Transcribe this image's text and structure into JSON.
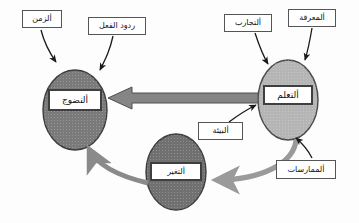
{
  "diagram": {
    "language": "ar",
    "background_color": "#fdfdfd",
    "nodes": [
      {
        "id": "maturity",
        "label": "ألنضوج",
        "shape": "ellipse",
        "fill": "#7a7a7a",
        "stroke": "#3d3d3d",
        "cx": 75,
        "cy": 110,
        "rx": 32,
        "ry": 40
      },
      {
        "id": "learning",
        "label": "ألتعلم",
        "shape": "ellipse",
        "fill": "#b5b5b5",
        "stroke": "#4a4a4a",
        "cx": 288,
        "cy": 100,
        "rx": 30,
        "ry": 40
      },
      {
        "id": "change",
        "label": "ألتغير",
        "shape": "ellipse",
        "fill": "#707070",
        "stroke": "#3d3d3d",
        "cx": 176,
        "cy": 172,
        "rx": 30,
        "ry": 38
      }
    ],
    "callouts": [
      {
        "id": "time",
        "label": "ألزمن",
        "target": "maturity",
        "x": 22,
        "y": 10,
        "w": 40,
        "h": 18
      },
      {
        "id": "reactions",
        "label": "ردود الفعل",
        "target": "maturity",
        "x": 88,
        "y": 17,
        "w": 58,
        "h": 18
      },
      {
        "id": "experiences",
        "label": "ألتجارب",
        "target": "learning",
        "x": 224,
        "y": 14,
        "w": 48,
        "h": 18
      },
      {
        "id": "knowledge",
        "label": "ألمعرفة",
        "target": "learning",
        "x": 288,
        "y": 9,
        "w": 48,
        "h": 18
      },
      {
        "id": "environment",
        "label": "ألبيئة",
        "target": "learning",
        "x": 198,
        "y": 122,
        "w": 45,
        "h": 18
      },
      {
        "id": "practices",
        "label": "ألممارسات",
        "target": "learning",
        "x": 276,
        "y": 160,
        "w": 60,
        "h": 19
      }
    ],
    "arrows": [
      {
        "id": "learning-to-maturity",
        "from": "learning",
        "to": "maturity",
        "style": "block",
        "color": "#808080"
      },
      {
        "id": "learning-to-change",
        "from": "learning",
        "to": "change",
        "style": "curved-thick",
        "color": "#9a9a9a"
      },
      {
        "id": "change-to-maturity",
        "from": "change",
        "to": "maturity",
        "style": "curved-thick",
        "color": "#8a8a8a"
      },
      {
        "id": "time-to-maturity",
        "from": "time",
        "to": "maturity",
        "style": "thin",
        "color": "#1a1a1a"
      },
      {
        "id": "reactions-to-maturity",
        "from": "reactions",
        "to": "maturity",
        "style": "thin",
        "color": "#1a1a1a"
      },
      {
        "id": "experiences-to-learning",
        "from": "experiences",
        "to": "learning",
        "style": "thin",
        "color": "#1a1a1a"
      },
      {
        "id": "knowledge-to-learning",
        "from": "knowledge",
        "to": "learning",
        "style": "thin",
        "color": "#1a1a1a"
      },
      {
        "id": "environment-to-learning",
        "from": "environment",
        "to": "learning",
        "style": "thin",
        "color": "#1a1a1a"
      },
      {
        "id": "practices-to-learning",
        "from": "practices",
        "to": "learning",
        "style": "thin",
        "color": "#1a1a1a"
      }
    ]
  }
}
